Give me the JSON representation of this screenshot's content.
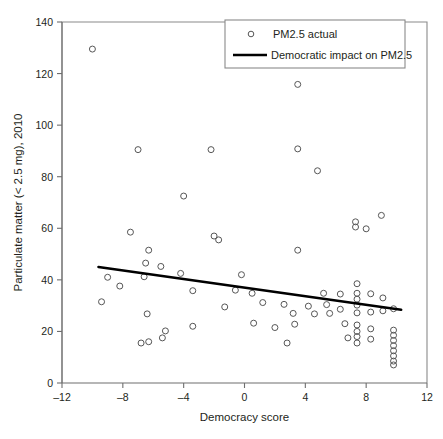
{
  "chart_data": {
    "type": "scatter",
    "title": "",
    "xlabel": "Democracy score",
    "ylabel": "Particulate matter (< 2.5 mg), 2010",
    "xlim": [
      -12,
      12
    ],
    "ylim": [
      0,
      140
    ],
    "xticks": [
      -12,
      -8,
      -4,
      0,
      4,
      8,
      12
    ],
    "yticks": [
      0,
      20,
      40,
      60,
      80,
      100,
      120,
      140
    ],
    "xtick_labels": [
      "–12",
      "–8",
      "–4",
      "0",
      "4",
      "8",
      "12"
    ],
    "ytick_labels": [
      "0",
      "20",
      "40",
      "60",
      "80",
      "100",
      "120",
      "140"
    ],
    "grid": false,
    "legend_position": "top-right",
    "legend": [
      {
        "label": "PM2.5 actual",
        "marker": "open-circle",
        "color": "#565656"
      },
      {
        "label": "Democratic impact on PM2.5",
        "marker": "line",
        "color": "#000000"
      }
    ],
    "series": [
      {
        "name": "PM2.5 actual",
        "marker": "open-circle",
        "points": [
          [
            -10.0,
            129.5
          ],
          [
            -7.0,
            90.5
          ],
          [
            3.5,
            115.8
          ],
          [
            3.5,
            90.8
          ],
          [
            -4.0,
            72.5
          ],
          [
            4.8,
            82.3
          ],
          [
            7.3,
            62.5
          ],
          [
            7.3,
            60.5
          ],
          [
            8.0,
            59.8
          ],
          [
            9.0,
            65.0
          ],
          [
            3.5,
            51.5
          ],
          [
            -7.5,
            58.5
          ],
          [
            -6.3,
            51.5
          ],
          [
            -6.5,
            46.5
          ],
          [
            -5.5,
            45.2
          ],
          [
            -6.6,
            41.2
          ],
          [
            -8.2,
            37.6
          ],
          [
            -9.4,
            31.5
          ],
          [
            -9.0,
            41.0
          ],
          [
            -4.2,
            42.5
          ],
          [
            -3.4,
            35.8
          ],
          [
            -3.4,
            22.0
          ],
          [
            -2.2,
            90.5
          ],
          [
            -2.0,
            57.0
          ],
          [
            -1.7,
            55.5
          ],
          [
            -1.3,
            29.5
          ],
          [
            -0.2,
            42.0
          ],
          [
            -0.6,
            36.0
          ],
          [
            0.5,
            34.8
          ],
          [
            1.2,
            31.2
          ],
          [
            0.6,
            23.2
          ],
          [
            2.0,
            21.5
          ],
          [
            -6.4,
            26.8
          ],
          [
            -5.2,
            20.2
          ],
          [
            -5.4,
            17.5
          ],
          [
            -6.3,
            16.0
          ],
          [
            -6.8,
            15.5
          ],
          [
            2.6,
            30.5
          ],
          [
            3.2,
            27.0
          ],
          [
            3.3,
            22.8
          ],
          [
            2.8,
            15.5
          ],
          [
            4.2,
            29.8
          ],
          [
            4.6,
            26.8
          ],
          [
            5.2,
            34.8
          ],
          [
            5.4,
            30.4
          ],
          [
            5.6,
            27.0
          ],
          [
            6.3,
            34.5
          ],
          [
            6.3,
            28.6
          ],
          [
            6.6,
            23.0
          ],
          [
            6.8,
            17.5
          ],
          [
            7.4,
            38.5
          ],
          [
            7.4,
            34.8
          ],
          [
            7.4,
            32.5
          ],
          [
            7.4,
            30.2
          ],
          [
            7.4,
            27.2
          ],
          [
            7.4,
            22.5
          ],
          [
            7.4,
            20.0
          ],
          [
            7.4,
            18.0
          ],
          [
            7.4,
            15.5
          ],
          [
            8.3,
            34.6
          ],
          [
            8.3,
            27.5
          ],
          [
            8.3,
            21.0
          ],
          [
            8.3,
            17.0
          ],
          [
            9.1,
            33.0
          ],
          [
            9.1,
            28.0
          ],
          [
            9.8,
            28.8
          ],
          [
            9.8,
            20.5
          ],
          [
            9.8,
            18.5
          ],
          [
            9.8,
            16.5
          ],
          [
            9.8,
            14.5
          ],
          [
            9.8,
            12.5
          ],
          [
            9.8,
            10.5
          ],
          [
            9.8,
            8.5
          ],
          [
            9.8,
            7.0
          ]
        ]
      }
    ],
    "fit_line": {
      "name": "Democratic impact on PM2.5",
      "x_start": -9.6,
      "y_start": 45.0,
      "x_end": 10.3,
      "y_end": 28.4,
      "color": "#000000"
    }
  }
}
